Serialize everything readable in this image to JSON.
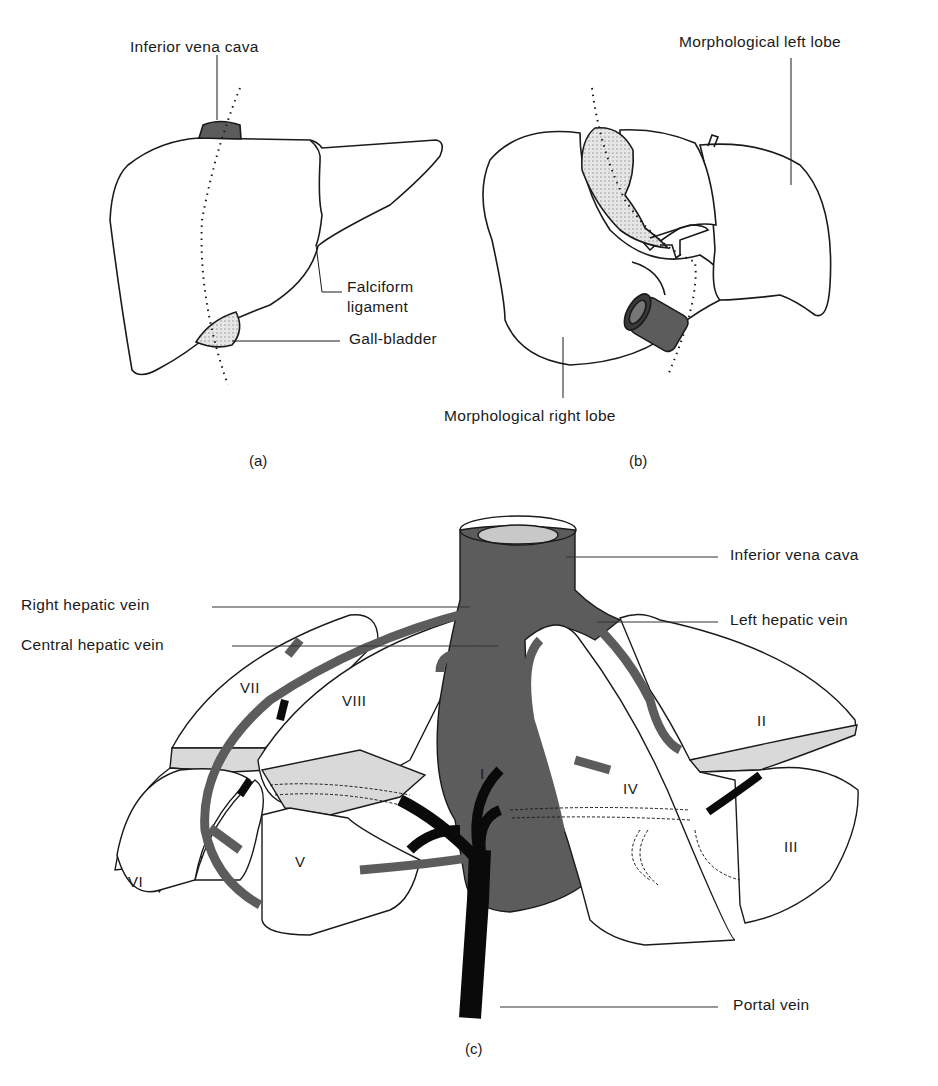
{
  "figure": {
    "panels": [
      {
        "id": "a",
        "caption": "(a)",
        "labels": {
          "ivc": "Inferior vena cava",
          "falciform_1": "Falciform",
          "falciform_2": "ligament",
          "gallbladder": "Gall-bladder"
        }
      },
      {
        "id": "b",
        "caption": "(b)",
        "labels": {
          "left_lobe": "Morphological left lobe",
          "right_lobe": "Morphological right lobe"
        }
      },
      {
        "id": "c",
        "caption": "(c)",
        "labels": {
          "ivc": "Inferior vena cava",
          "right_hepatic": "Right hepatic vein",
          "left_hepatic": "Left hepatic vein",
          "central_hepatic": "Central hepatic vein",
          "portal": "Portal vein"
        },
        "segments": [
          "I",
          "II",
          "III",
          "IV",
          "V",
          "VI",
          "VII",
          "VIII"
        ]
      }
    ],
    "colors": {
      "line": "#1a1a1a",
      "hepatic_vein": "#5c5c5c",
      "portal_vein": "#0a0a0a",
      "shade": "#d9d9d9",
      "ivc_lumen": "#c8c8c8",
      "background": "#ffffff"
    }
  }
}
